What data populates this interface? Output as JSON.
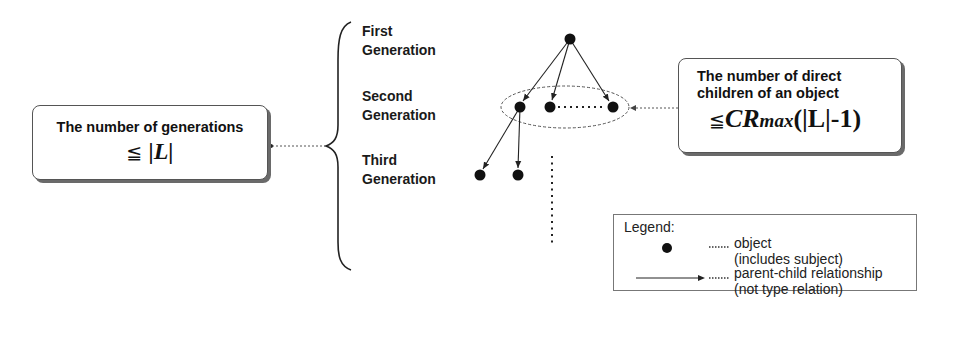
{
  "left_box": {
    "title": "The number of generations",
    "formula_leq": "≦",
    "formula_expr": "|L|"
  },
  "generations": [
    {
      "line1": "First",
      "line2": "Generation"
    },
    {
      "line1": "Second",
      "line2": "Generation"
    },
    {
      "line1": "Third",
      "line2": "Generation"
    }
  ],
  "right_box": {
    "title_line1": "The number of direct",
    "title_line2": "children of an object",
    "formula_leq": "≦",
    "formula_cr": "CR",
    "formula_max": "max",
    "formula_rest": "(|L|-1)"
  },
  "legend": {
    "title": "Legend:",
    "items": [
      {
        "symbol": "filled-circle",
        "line1": "object",
        "line2": "(includes subject)"
      },
      {
        "symbol": "arrow",
        "line1": "parent-child relationship",
        "line2": "(not type relation)"
      }
    ]
  },
  "tree": {
    "nodes": [
      {
        "id": "root",
        "generation": 1,
        "x": 570,
        "y": 39
      },
      {
        "id": "g2a",
        "generation": 2,
        "x": 520,
        "y": 107
      },
      {
        "id": "g2b",
        "generation": 2,
        "x": 550,
        "y": 107
      },
      {
        "id": "g2c",
        "generation": 2,
        "x": 613,
        "y": 107
      },
      {
        "id": "g3a",
        "generation": 3,
        "x": 480,
        "y": 175
      },
      {
        "id": "g3b",
        "generation": 3,
        "x": 518,
        "y": 175
      }
    ],
    "edges": [
      [
        "root",
        "g2a"
      ],
      [
        "root",
        "g2b"
      ],
      [
        "root",
        "g2c"
      ],
      [
        "g2a",
        "g3a"
      ],
      [
        "g2a",
        "g3b"
      ]
    ]
  },
  "colors": {
    "ink": "#111111",
    "dotted": "#555555",
    "shadow": "#6a6a6a"
  }
}
